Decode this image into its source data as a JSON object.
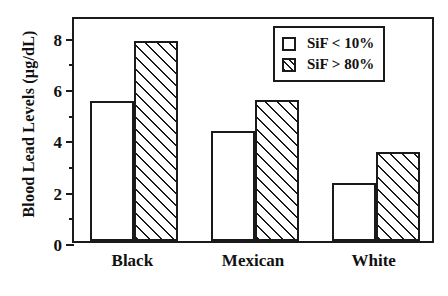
{
  "chart_data": {
    "type": "bar",
    "title": "",
    "xlabel": "",
    "ylabel": "Blood Lead Levels (µg/dL)",
    "categories": [
      "Black",
      "Mexican",
      "White"
    ],
    "series": [
      {
        "name": "SiF < 10%",
        "fill": "empty",
        "values": [
          5.45,
          4.3,
          2.25
        ]
      },
      {
        "name": "SiF > 80%",
        "fill": "hatched",
        "values": [
          7.8,
          5.5,
          3.45
        ]
      }
    ],
    "ylim": [
      0,
      8.8
    ],
    "ytick_labels": [
      "0",
      "2",
      "4",
      "6",
      "8"
    ],
    "ytick_values": [
      0,
      2,
      4,
      6,
      8
    ],
    "yminor_values": [
      1,
      3,
      5,
      7
    ],
    "grid": false,
    "legend_position": "top-right",
    "colors": {
      "axis": "#1a1a1a",
      "bar_fill": "#ffffff",
      "hatch": "#1a1a1a",
      "background": "#ffffff"
    }
  },
  "legend": {
    "items": [
      {
        "label": "SiF < 10%",
        "swatch": "empty-square-swatch"
      },
      {
        "label": "SiF > 80%",
        "swatch": "hatched-square-swatch"
      }
    ]
  },
  "axes": {
    "y_title": "Blood Lead Levels (µg/dL)",
    "y_ticks": [
      "8",
      "6",
      "4",
      "2",
      "0"
    ],
    "x_categories": [
      "Black",
      "Mexican",
      "White"
    ]
  }
}
